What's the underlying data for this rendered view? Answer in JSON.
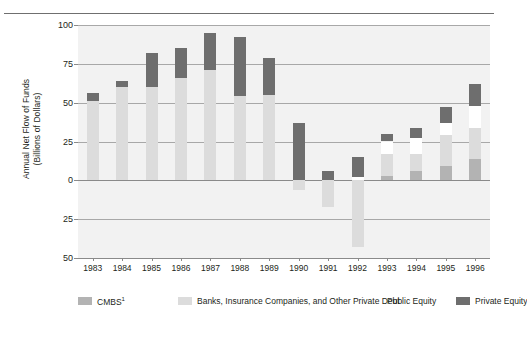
{
  "chart_data": {
    "type": "bar",
    "subtype": "stacked-bar",
    "title": "",
    "xlabel": "",
    "ylabel": "Annual Net Flow of Funds (Billions of Dollars)",
    "ylabel_lines": [
      "Annual Net Flow of Funds",
      "(Billions of Dollars)"
    ],
    "categories": [
      "1983",
      "1984",
      "1985",
      "1986",
      "1987",
      "1988",
      "1989",
      "1990",
      "1991",
      "1992",
      "1993",
      "1994",
      "1995",
      "1996"
    ],
    "ylim": [
      -50,
      100
    ],
    "yticks": [
      100,
      75,
      50,
      25,
      0,
      25,
      50
    ],
    "ytick_labels": [
      "100",
      "75",
      "50",
      "25",
      "0",
      "25",
      "50"
    ],
    "ytick_values": [
      100,
      75,
      50,
      25,
      0,
      -25,
      -50
    ],
    "grid": true,
    "legend_position": "bottom",
    "series": [
      {
        "name": "CMBS",
        "name_display": "CMBS",
        "superscript": "1",
        "color": "#b3b3b3",
        "values": [
          0,
          0,
          0,
          0,
          0,
          0,
          0,
          0,
          0,
          0,
          3,
          6,
          9,
          14
        ]
      },
      {
        "name": "Banks, Insurance Companies, and Other Private Debt",
        "color": "#dcdcdc",
        "values": [
          51,
          60,
          60,
          66,
          71,
          54,
          55,
          -6,
          -17,
          -43,
          14,
          11,
          20,
          20
        ]
      },
      {
        "name": "Public Equity",
        "color": "#ffffff",
        "values": [
          0,
          0,
          0,
          0,
          0,
          0,
          0,
          0,
          0,
          2,
          8,
          10,
          8,
          14
        ]
      },
      {
        "name": "Private Equity",
        "color": "#6e6e6e",
        "values": [
          5,
          4,
          22,
          19,
          24,
          38,
          24,
          37,
          6,
          13,
          5,
          7,
          10,
          14
        ]
      }
    ]
  },
  "legend": {
    "items": [
      {
        "label": "CMBS",
        "superscript": "1",
        "color": "#b3b3b3"
      },
      {
        "label": "Banks, Insurance Companies, and Other Private Debt",
        "superscript": "",
        "color": "#dcdcdc"
      },
      {
        "label": "Public Equity",
        "superscript": "",
        "color": "#ffffff"
      },
      {
        "label": "Private Equity",
        "superscript": "",
        "color": "#6e6e6e"
      }
    ]
  },
  "colors": {
    "plot_background": "#f2f2f2",
    "gridline": "#a8a8a8",
    "axis": "#8a8a8a",
    "text": "#231f20",
    "page_background": "#ffffff"
  }
}
